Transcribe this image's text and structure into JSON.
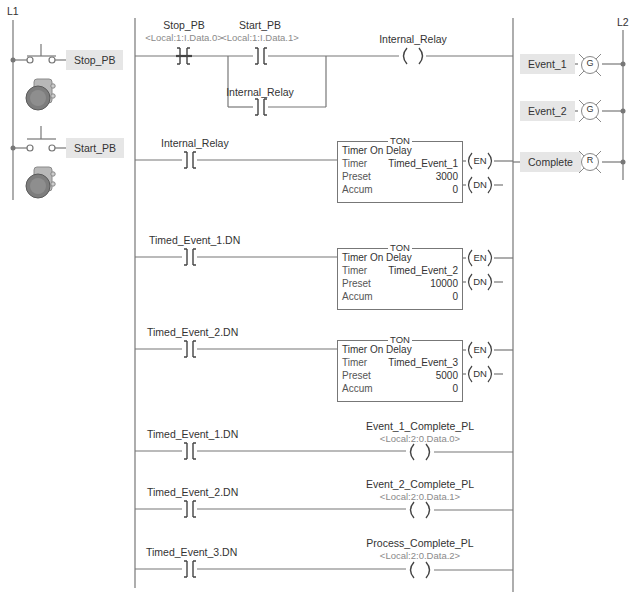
{
  "rails": {
    "left_label": "L1",
    "right_label": "L2"
  },
  "field_devices": {
    "inputs": [
      {
        "label": "Stop_PB",
        "type": "normally-closed-pushbutton"
      },
      {
        "label": "Start_PB",
        "type": "normally-open-pushbutton"
      }
    ],
    "outputs": [
      {
        "label": "Event_1",
        "lamp_letter": "G"
      },
      {
        "label": "Event_2",
        "lamp_letter": "G"
      },
      {
        "label": "Complete",
        "lamp_letter": "R"
      }
    ]
  },
  "rungs": [
    {
      "contacts": [
        {
          "tag": "Stop_PB",
          "address": "<Local:1:I.Data.0>",
          "type": "XIO"
        },
        {
          "tag": "Start_PB",
          "address": "<Local:1:I.Data.1>",
          "type": "XIC"
        }
      ],
      "branch": {
        "tag": "Internal_Relay",
        "type": "XIC"
      },
      "output": {
        "tag": "Internal_Relay",
        "type": "OTE"
      }
    },
    {
      "contacts": [
        {
          "tag": "Internal_Relay",
          "type": "XIC"
        }
      ],
      "timer": {
        "title": "TON",
        "subtitle": "Timer On Delay",
        "timer_label": "Timer",
        "timer": "Timed_Event_1",
        "preset_label": "Preset",
        "preset": "3000",
        "accum_label": "Accum",
        "accum": "0",
        "en": "EN",
        "dn": "DN"
      }
    },
    {
      "contacts": [
        {
          "tag": "Timed_Event_1.DN",
          "type": "XIC"
        }
      ],
      "timer": {
        "title": "TON",
        "subtitle": "Timer On Delay",
        "timer_label": "Timer",
        "timer": "Timed_Event_2",
        "preset_label": "Preset",
        "preset": "10000",
        "accum_label": "Accum",
        "accum": "0",
        "en": "EN",
        "dn": "DN"
      }
    },
    {
      "contacts": [
        {
          "tag": "Timed_Event_2.DN",
          "type": "XIC"
        }
      ],
      "timer": {
        "title": "TON",
        "subtitle": "Timer On Delay",
        "timer_label": "Timer",
        "timer": "Timed_Event_3",
        "preset_label": "Preset",
        "preset": "5000",
        "accum_label": "Accum",
        "accum": "0",
        "en": "EN",
        "dn": "DN"
      }
    },
    {
      "contacts": [
        {
          "tag": "Timed_Event_1.DN",
          "type": "XIC"
        }
      ],
      "output": {
        "tag": "Event_1_Complete_PL",
        "address": "<Local:2:0.Data.0>",
        "type": "OTE"
      }
    },
    {
      "contacts": [
        {
          "tag": "Timed_Event_2.DN",
          "type": "XIC"
        }
      ],
      "output": {
        "tag": "Event_2_Complete_PL",
        "address": "<Local:2:0.Data.1>",
        "type": "OTE"
      }
    },
    {
      "contacts": [
        {
          "tag": "Timed_Event_3.DN",
          "type": "XIC"
        }
      ],
      "output": {
        "tag": "Process_Complete_PL",
        "address": "<Local:2:0.Data.2>",
        "type": "OTE"
      }
    }
  ],
  "colors": {
    "line": "#777777",
    "tag_bg": "#e6e6e6",
    "address_text": "#8a8a8a"
  }
}
